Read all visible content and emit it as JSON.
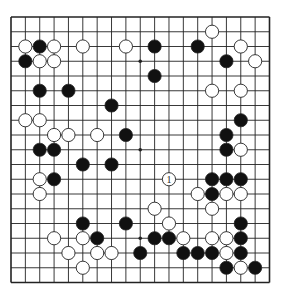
{
  "diagram": {
    "type": "go-board",
    "size": 19,
    "board": {
      "left": 11,
      "top": 17,
      "right": 269.5,
      "bottom": 282.5,
      "line_color": "#222222",
      "background": "#ffffff",
      "stone_radius": 6.6
    },
    "colors": {
      "black": "#111111",
      "white": "#ffffff",
      "stone_outline": "#222222"
    },
    "hoshi": [
      [
        9,
        3
      ],
      [
        9,
        9
      ],
      [
        9,
        15
      ]
    ],
    "black_stones": [
      [
        2,
        2
      ],
      [
        1,
        3
      ],
      [
        10,
        2
      ],
      [
        13,
        2
      ],
      [
        15,
        3
      ],
      [
        2,
        5
      ],
      [
        4,
        5
      ],
      [
        10,
        4
      ],
      [
        7,
        6
      ],
      [
        16,
        7
      ],
      [
        8,
        8
      ],
      [
        15,
        8
      ],
      [
        2,
        9
      ],
      [
        3,
        9
      ],
      [
        15,
        9
      ],
      [
        5,
        10
      ],
      [
        7,
        10
      ],
      [
        3,
        11
      ],
      [
        14,
        11
      ],
      [
        15,
        11
      ],
      [
        16,
        11
      ],
      [
        14,
        12
      ],
      [
        5,
        14
      ],
      [
        8,
        14
      ],
      [
        16,
        14
      ],
      [
        6,
        15
      ],
      [
        10,
        15
      ],
      [
        11,
        15
      ],
      [
        16,
        15
      ],
      [
        9,
        16
      ],
      [
        12,
        16
      ],
      [
        13,
        16
      ],
      [
        14,
        16
      ],
      [
        16,
        16
      ],
      [
        15,
        17
      ],
      [
        17,
        17
      ]
    ],
    "white_stones": [
      [
        1,
        2
      ],
      [
        3,
        2
      ],
      [
        5,
        2
      ],
      [
        8,
        2
      ],
      [
        14,
        1
      ],
      [
        16,
        2
      ],
      [
        2,
        3
      ],
      [
        3,
        3
      ],
      [
        17,
        3
      ],
      [
        14,
        5
      ],
      [
        16,
        5
      ],
      [
        1,
        7
      ],
      [
        2,
        7
      ],
      [
        3,
        8
      ],
      [
        4,
        8
      ],
      [
        6,
        8
      ],
      [
        16,
        9
      ],
      [
        2,
        11
      ],
      [
        2,
        12
      ],
      [
        13,
        12
      ],
      [
        15,
        12
      ],
      [
        16,
        12
      ],
      [
        10,
        13
      ],
      [
        14,
        13
      ],
      [
        11,
        14
      ],
      [
        3,
        15
      ],
      [
        5,
        15
      ],
      [
        12,
        15
      ],
      [
        14,
        15
      ],
      [
        15,
        15
      ],
      [
        4,
        16
      ],
      [
        6,
        16
      ],
      [
        7,
        16
      ],
      [
        15,
        16
      ],
      [
        5,
        17
      ],
      [
        16,
        17
      ]
    ],
    "numbered_stones": [
      {
        "col": 11,
        "row": 11,
        "color": "white",
        "label": "1"
      }
    ]
  }
}
